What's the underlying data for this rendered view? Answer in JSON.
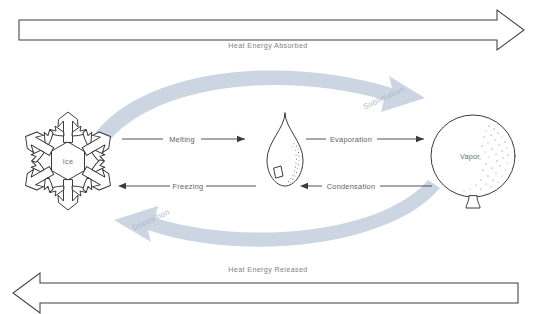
{
  "diagram": {
    "background_color": "#ffffff",
    "ink_color": "#3a3c41",
    "curve_color": "#ccd5e2",
    "curve_label_color": "#aeb6c6"
  },
  "energy_bands": {
    "top": {
      "label": "Heat Energy Absorbed",
      "direction": "right"
    },
    "bottom": {
      "label": "Heat Energy Released",
      "direction": "left"
    }
  },
  "phases": [
    {
      "id": "ice",
      "label": "Ice",
      "icon": "snowflake-icon"
    },
    {
      "id": "water",
      "label": "",
      "icon": "water-droplet-icon"
    },
    {
      "id": "vapor",
      "label": "Vapor",
      "icon": "balloon-icon"
    }
  ],
  "transitions": [
    {
      "id": "melting",
      "label": "Melting",
      "from": "ice",
      "to": "water",
      "direction": "right",
      "row": "top"
    },
    {
      "id": "evaporation",
      "label": "Evaporation",
      "from": "water",
      "to": "vapor",
      "direction": "right",
      "row": "top"
    },
    {
      "id": "freezing",
      "label": "Freezing",
      "from": "water",
      "to": "ice",
      "direction": "left",
      "row": "bottom"
    },
    {
      "id": "condensation",
      "label": "Condensation",
      "from": "vapor",
      "to": "water",
      "direction": "left",
      "row": "bottom"
    },
    {
      "id": "sublimation",
      "label": "Sublimation",
      "from": "ice",
      "to": "vapor",
      "direction": "right",
      "row": "curve-top"
    },
    {
      "id": "deposition",
      "label": "Deposition",
      "from": "vapor",
      "to": "ice",
      "direction": "left",
      "row": "curve-bottom"
    }
  ]
}
